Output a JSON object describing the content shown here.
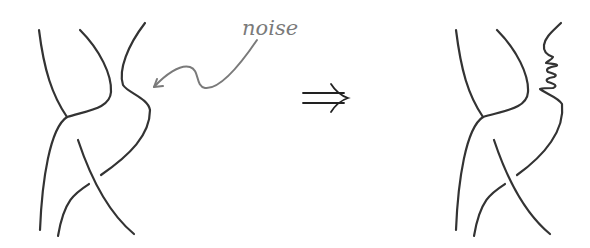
{
  "diagram": {
    "left_figure": {
      "description": "tangle of curves before transformation",
      "annotation": {
        "label": "noise",
        "color": "#7a7a7a"
      }
    },
    "transform_symbol": {
      "glyph": "⇒",
      "meaning": "implies / transforms to"
    },
    "right_figure": {
      "description": "same tangle with noise wiggle added to the right strand"
    },
    "colors": {
      "strand": "#333333",
      "annotation": "#7a7a7a",
      "background": "#ffffff"
    }
  }
}
